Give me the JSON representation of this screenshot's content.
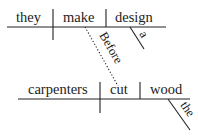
{
  "diagram": {
    "type": "sentence-diagram",
    "clause_main": {
      "subject": "they",
      "verb": "make",
      "object": "design",
      "object_modifier": "a"
    },
    "connector": "Before",
    "clause_subordinate": {
      "subject": "carpenters",
      "verb": "cut",
      "object": "wood",
      "object_modifier": "the"
    }
  }
}
